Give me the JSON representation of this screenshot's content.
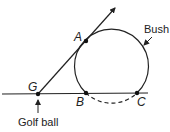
{
  "diagram": {
    "points": {
      "G": {
        "label": "G",
        "x": 38,
        "y": 94
      },
      "A": {
        "label": "A",
        "x": 86,
        "y": 41
      },
      "B": {
        "label": "B",
        "x": 86,
        "y": 93
      },
      "C": {
        "label": "C",
        "x": 137,
        "y": 93
      }
    },
    "circle": {
      "cx": 112,
      "cy": 64,
      "r": 37
    },
    "labels": {
      "bush": "Bush",
      "golf_ball": "Golf ball"
    },
    "colors": {
      "stroke": "#222222",
      "background": "#ffffff"
    }
  }
}
